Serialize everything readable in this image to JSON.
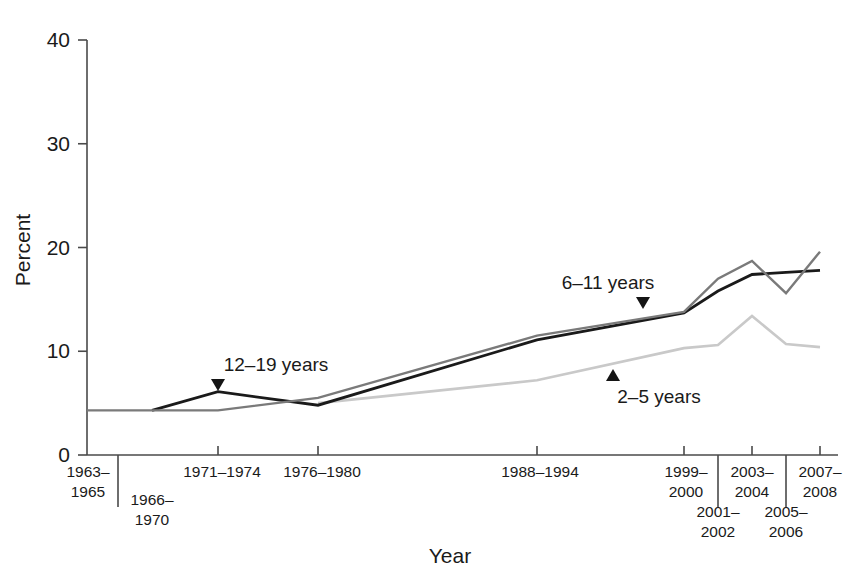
{
  "chart_data": {
    "type": "line",
    "title": "",
    "xlabel": "Year",
    "ylabel": "Percent",
    "ylim": [
      0,
      40
    ],
    "yticks": [
      0,
      10,
      20,
      30,
      40
    ],
    "ytick_labels": [
      "0",
      "10",
      "20",
      "30",
      "40"
    ],
    "grid": false,
    "legend_position": "inline-annotations",
    "categories": [
      "1963–1965",
      "1966–1970",
      "1971–1974",
      "1976–1980",
      "1988–1994",
      "1999–2000",
      "2001–2002",
      "2003–2004",
      "2005–2006",
      "2007–2008"
    ],
    "series": [
      {
        "name": "2–5 years",
        "color": "#c9c9c9",
        "x": [
          "1976–1980",
          "1988–1994",
          "1999–2000",
          "2001–2002",
          "2003–2004",
          "2005–2006",
          "2007–2008"
        ],
        "values": [
          5.0,
          7.2,
          10.3,
          10.6,
          13.4,
          10.7,
          10.4
        ]
      },
      {
        "name": "6–11 years",
        "color": "#1a1a1a",
        "x": [
          "1966–1970",
          "1971–1974",
          "1976–1980",
          "1988–1994",
          "1999–2000",
          "2001–2002",
          "2003–2004",
          "2005–2006",
          "2007–2008"
        ],
        "values": [
          4.3,
          6.1,
          4.8,
          11.1,
          13.7,
          15.8,
          17.4,
          17.6,
          17.8
        ]
      },
      {
        "name": "12–19 years",
        "color": "#7a7a7a",
        "x": [
          "1963–1965",
          "1966–1970",
          "1971–1974",
          "1976–1980",
          "1988–1994",
          "1999–2000",
          "2001–2002",
          "2003–2004",
          "2005–2006",
          "2007–2008"
        ],
        "values": [
          4.3,
          4.3,
          4.3,
          5.5,
          11.5,
          13.8,
          17.0,
          18.7,
          15.6,
          19.6
        ]
      }
    ],
    "annotations": [
      {
        "text": "12–19 years",
        "anchor_category": "1971–1974",
        "anchor_value": 6.1,
        "marker": "triangle-down"
      },
      {
        "text": "6–11 years",
        "anchor_category": "1999–2000",
        "anchor_value": 13.7,
        "marker": "triangle-down"
      },
      {
        "text": "2–5 years",
        "anchor_category": "1988–1994",
        "anchor_value": 8.0,
        "marker": "triangle-up"
      }
    ]
  },
  "axes": {
    "y_title": "Percent",
    "x_title": "Year",
    "y_labels": [
      "40",
      "30",
      "20",
      "10",
      "0"
    ],
    "x_labels": [
      {
        "line1": "1963–",
        "line2": "1965"
      },
      {
        "line1": "1966–",
        "line2": "1970"
      },
      {
        "line1": "1971–1974",
        "line2": ""
      },
      {
        "line1": "1976–1980",
        "line2": ""
      },
      {
        "line1": "1988–1994",
        "line2": ""
      },
      {
        "line1": "1999–",
        "line2": "2000"
      },
      {
        "line1": "2001–",
        "line2": "2002"
      },
      {
        "line1": "2003–",
        "line2": "2004"
      },
      {
        "line1": "2005–",
        "line2": "2006"
      },
      {
        "line1": "2007–",
        "line2": "2008"
      }
    ]
  },
  "series_labels": {
    "teen": "12–19 years",
    "child": "6–11 years",
    "preschool": "2–5 years"
  },
  "colors": {
    "axis": "#4a4a4a",
    "text": "#1a1a1a",
    "series_2_5": "#c9c9c9",
    "series_6_11": "#1a1a1a",
    "series_12_19": "#7a7a7a",
    "background": "#ffffff"
  }
}
